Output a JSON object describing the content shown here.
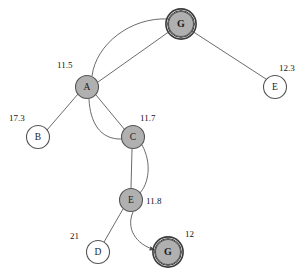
{
  "diagram": {
    "width": 308,
    "height": 277,
    "background": "#ffffff",
    "colors": {
      "node_fill_expanded": "#b0b0b0",
      "node_fill_frontier": "#ffffff",
      "node_stroke": "#555555",
      "goal_ring": "#3a3a3a",
      "edge_stroke": "#5a5a5a",
      "text": "#1a1a1a"
    }
  },
  "nodes": [
    {
      "id": "goal_top",
      "label": "G",
      "cx": 181,
      "cy": 24,
      "r": 12.5,
      "fill": "#b0b0b0",
      "goal": true,
      "cost": null
    },
    {
      "id": "a",
      "label": "A",
      "cx": 87,
      "cy": 87,
      "r": 11.5,
      "fill": "#b0b0b0",
      "goal": false,
      "cost": "11.5",
      "cost_x": 57,
      "cost_y": 66
    },
    {
      "id": "e_right",
      "label": "E",
      "cx": 275,
      "cy": 87,
      "r": 11.5,
      "fill": "#ffffff",
      "goal": false,
      "cost": "12.3",
      "cost_x": 279,
      "cost_y": 69
    },
    {
      "id": "b",
      "label": "B",
      "cx": 38,
      "cy": 137,
      "r": 11.5,
      "fill": "#ffffff",
      "goal": false,
      "cost": "17.3",
      "cost_x": 9,
      "cost_y": 119
    },
    {
      "id": "c",
      "label": "C",
      "cx": 133,
      "cy": 137,
      "r": 11.5,
      "fill": "#b0b0b0",
      "goal": false,
      "cost": "11.7",
      "cost_x": 140,
      "cost_y": 119
    },
    {
      "id": "e_mid",
      "label": "E",
      "cx": 131,
      "cy": 200,
      "r": 11.5,
      "fill": "#b0b0b0",
      "goal": false,
      "cost": "11.8",
      "cost_x": 146,
      "cost_y": 202
    },
    {
      "id": "d",
      "label": "D",
      "cx": 98,
      "cy": 252,
      "r": 11.5,
      "fill": "#ffffff",
      "goal": false,
      "cost": "21",
      "cost_x": 70,
      "cost_y": 237
    },
    {
      "id": "goal_bottom",
      "label": "G",
      "cx": 168,
      "cy": 252,
      "r": 12.5,
      "fill": "#b0b0b0",
      "goal": true,
      "cost": "12",
      "cost_x": 185,
      "cost_y": 235
    }
  ],
  "edges": [
    {
      "id": "a-goaltop-curved",
      "from": "a",
      "to": "goal_top",
      "path": "M 92 76 C 96 44 131 17 168 19",
      "arrow": false
    },
    {
      "id": "a-goaltop-straight",
      "from": "a",
      "to": "goal_top",
      "path": "M 98 82 L 170 31",
      "arrow": false
    },
    {
      "id": "goaltop-eright",
      "from": "goal_top",
      "to": "e_right",
      "path": "M 192 31 L 266 79",
      "arrow": false
    },
    {
      "id": "a-b",
      "from": "a",
      "to": "b",
      "path": "M 78 94 L 47 130",
      "arrow": false
    },
    {
      "id": "a-c-straight",
      "from": "a",
      "to": "c",
      "path": "M 96 95 L 125 130",
      "arrow": false
    },
    {
      "id": "a-c-curved",
      "from": "a",
      "to": "c",
      "path": "M 89 99 C 90 122 100 140 122 139",
      "arrow": false
    },
    {
      "id": "c-emid-straight",
      "from": "c",
      "to": "e_mid",
      "path": "M 132 149 L 131 188",
      "arrow": false
    },
    {
      "id": "c-emid-curved",
      "from": "c",
      "to": "e_mid",
      "path": "M 142 145 C 152 163 149 184 139 194",
      "arrow": false
    },
    {
      "id": "emid-d",
      "from": "e_mid",
      "to": "d",
      "path": "M 123 209 L 104 242",
      "arrow": false
    },
    {
      "id": "emid-goalbottom",
      "from": "e_mid",
      "to": "goal_bottom",
      "path": "M 133 212 C 126 228 135 244 155 250",
      "arrow": true
    }
  ]
}
